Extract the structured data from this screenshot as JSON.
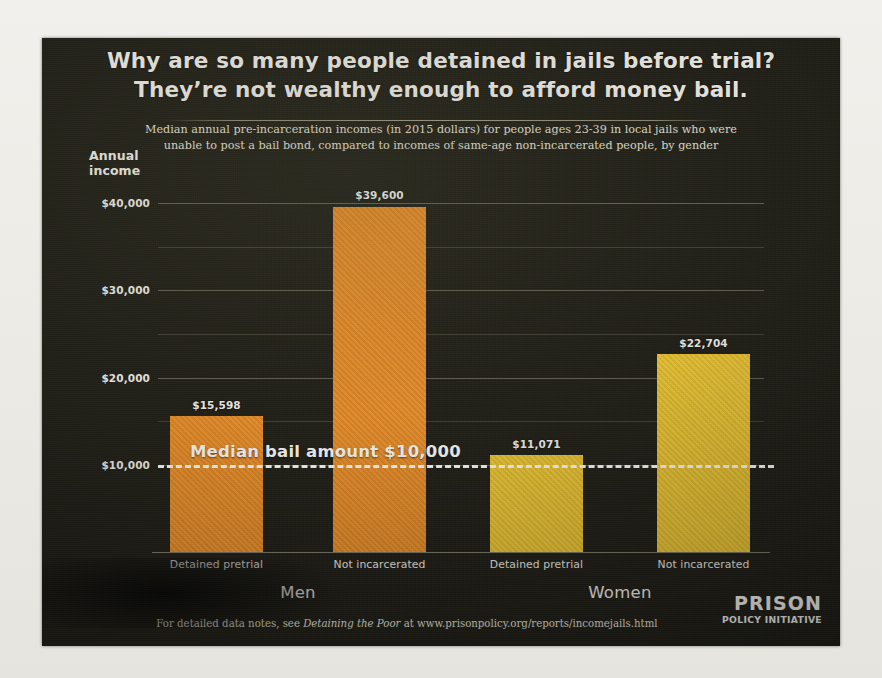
{
  "poster": {
    "headline_line1": "Why are so many people detained in jails before trial?",
    "headline_line2": "They’re not wealthy enough to afford money bail.",
    "subtitle_line1": "Median annual pre-incarceration incomes (in 2015 dollars) for people ages 23-39 in local jails who were",
    "subtitle_line2": "unable to post a bail bond, compared to incomes of same-age non-incarcerated people, by gender",
    "axis_title_line1": "Annual",
    "axis_title_line2": "income",
    "footer_prefix": "For detailed data notes, see ",
    "footer_italic": "Detaining the Poor",
    "footer_suffix": " at www.prisonpolicy.org/reports/incomejails.html",
    "logo_line1": "PRISON",
    "logo_line2": "POLICY INITIATIVE"
  },
  "annotation": {
    "median_bail_caption": "Median bail amount $10,000",
    "median_bail_value": 10000
  },
  "colors": {
    "background": "#1f1e17",
    "men_bar": "#f08f24",
    "women_bar": "#f3c92d",
    "text": "#f6f4ee",
    "gridline": "#c6c2aa",
    "median_line": "#ffffff"
  },
  "chart_data": {
    "type": "bar",
    "title": "Why are so many people detained in jails before trial? They’re not wealthy enough to afford money bail.",
    "subtitle": "Median annual pre-incarceration incomes (in 2015 dollars) for people ages 23-39 in local jails who were unable to post a bail bond, compared to incomes of same-age non-incarcerated people, by gender",
    "xlabel": "",
    "ylabel": "Annual income",
    "ylim": [
      0,
      40000
    ],
    "grid": true,
    "legend": "none",
    "ytick_labels": [
      "$10,000",
      "$20,000",
      "$30,000",
      "$40,000"
    ],
    "ytick_values": [
      10000,
      20000,
      30000,
      40000
    ],
    "minor_gridline_values": [
      15000,
      25000,
      35000
    ],
    "groups": [
      "Men",
      "Women"
    ],
    "categories": [
      "Detained pretrial",
      "Not incarcerated",
      "Detained pretrial",
      "Not incarcerated"
    ],
    "bars": [
      {
        "group": "Men",
        "category": "Detained pretrial",
        "value": 15598,
        "label": "$15,598",
        "color": "#f08f24"
      },
      {
        "group": "Men",
        "category": "Not incarcerated",
        "value": 39600,
        "label": "$39,600",
        "color": "#f08f24"
      },
      {
        "group": "Women",
        "category": "Detained pretrial",
        "value": 11071,
        "label": "$11,071",
        "color": "#f3c92d"
      },
      {
        "group": "Women",
        "category": "Not incarcerated",
        "value": 22704,
        "label": "$22,704",
        "color": "#f3c92d"
      }
    ],
    "reference_line": {
      "label": "Median bail amount $10,000",
      "value": 10000,
      "style": "dashed",
      "color": "#ffffff"
    }
  }
}
